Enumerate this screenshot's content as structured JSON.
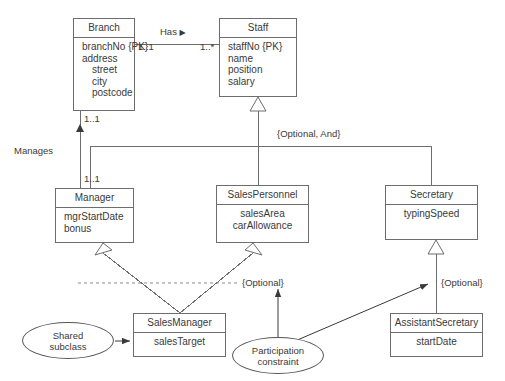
{
  "diagram": {
    "classes": [
      {
        "id": "branch",
        "name": "Branch",
        "attributes": [
          "branchNo {PK}",
          "address",
          "street",
          "city",
          "postcode"
        ]
      },
      {
        "id": "staff",
        "name": "Staff",
        "attributes": [
          "staffNo {PK}",
          "name",
          "position",
          "salary"
        ]
      },
      {
        "id": "manager",
        "name": "Manager",
        "attributes": [
          "mgrStartDate",
          "bonus"
        ]
      },
      {
        "id": "salespersonnel",
        "name": "SalesPersonnel",
        "attributes": [
          "salesArea",
          "carAllowance"
        ]
      },
      {
        "id": "secretary",
        "name": "Secretary",
        "attributes": [
          "typingSpeed"
        ]
      },
      {
        "id": "salesmanager",
        "name": "SalesManager",
        "attributes": [
          "salesTarget"
        ]
      },
      {
        "id": "assistantsecretary",
        "name": "AssistantSecretary",
        "attributes": [
          "startDate"
        ]
      }
    ],
    "associations": [
      {
        "id": "has",
        "label": "Has",
        "direction_marker": "▶",
        "source_multiplicity": "1..1",
        "target_multiplicity": "1..*"
      },
      {
        "id": "manages",
        "label": "Manages",
        "direction_marker": "▲",
        "source_multiplicity": "1..1",
        "target_multiplicity": "1..1"
      }
    ],
    "constraints": [
      {
        "id": "optional-and",
        "text": "{Optional, And}"
      },
      {
        "id": "optional-left",
        "text": "{Optional}"
      },
      {
        "id": "optional-right",
        "text": "{Optional}"
      }
    ],
    "annotations": [
      {
        "id": "shared-subclass",
        "line1": "Shared",
        "line2": "subclass"
      },
      {
        "id": "participation-constraint",
        "line1": "Participation",
        "line2": "constraint"
      }
    ],
    "multiplicities": {
      "branch_has": "1..1",
      "staff_has": "1..*",
      "branch_manages": "1..1",
      "manager_manages": "1..1"
    },
    "colors": {
      "line": "#6d6d6d",
      "text": "#3a3a3a",
      "background": "#ffffff"
    }
  }
}
